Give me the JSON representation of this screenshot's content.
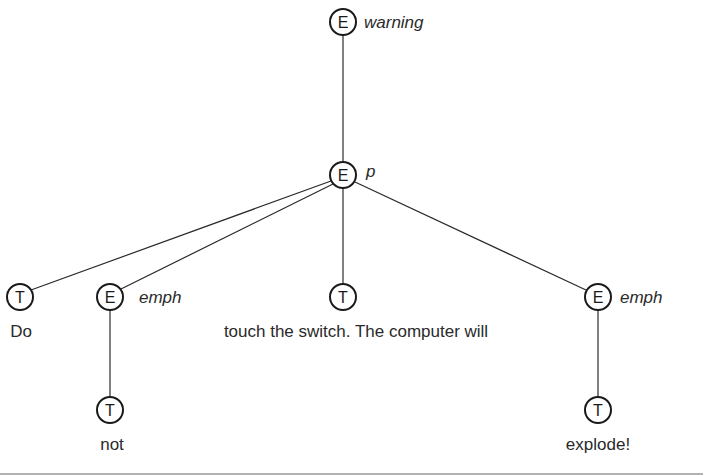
{
  "diagram": {
    "title": "",
    "nodes": [
      {
        "id": "n_warning",
        "type": "E",
        "tag": "warning",
        "x": 343,
        "y": 22
      },
      {
        "id": "n_p",
        "type": "E",
        "tag": "p",
        "x": 343,
        "y": 175
      },
      {
        "id": "n_do",
        "type": "T",
        "text": "Do",
        "x": 20,
        "y": 297
      },
      {
        "id": "n_emph1",
        "type": "E",
        "tag": "emph",
        "x": 110,
        "y": 297
      },
      {
        "id": "n_touch",
        "type": "T",
        "text": "touch the switch. The computer will",
        "x": 343,
        "y": 297
      },
      {
        "id": "n_emph2",
        "type": "E",
        "tag": "emph",
        "x": 598,
        "y": 297
      },
      {
        "id": "n_not",
        "type": "T",
        "text": "not",
        "x": 110,
        "y": 410
      },
      {
        "id": "n_explode",
        "type": "T",
        "text": "explode!",
        "x": 598,
        "y": 410
      }
    ],
    "edges": [
      [
        "n_warning",
        "n_p"
      ],
      [
        "n_p",
        "n_do"
      ],
      [
        "n_p",
        "n_emph1"
      ],
      [
        "n_p",
        "n_touch"
      ],
      [
        "n_p",
        "n_emph2"
      ],
      [
        "n_emph1",
        "n_not"
      ],
      [
        "n_emph2",
        "n_explode"
      ]
    ]
  },
  "labels": {
    "warning_letter": "E",
    "warning_tag": "warning",
    "p_letter": "E",
    "p_tag": "p",
    "do_letter": "T",
    "do_text": "Do",
    "emph1_letter": "E",
    "emph1_tag": "emph",
    "touch_letter": "T",
    "touch_text": "touch the switch. The computer will",
    "emph2_letter": "E",
    "emph2_tag": "emph",
    "not_letter": "T",
    "not_text": "not",
    "explode_letter": "T",
    "explode_text": "explode!"
  }
}
